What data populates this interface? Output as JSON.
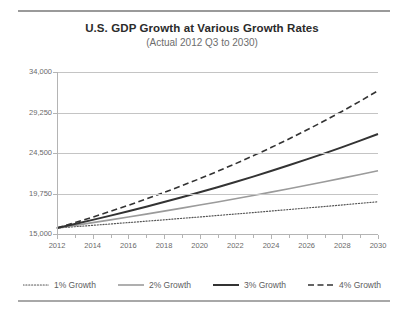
{
  "chart_data": {
    "type": "line",
    "title": "U.S. GDP Growth at Various Growth Rates",
    "subtitle": "(Actual 2012 Q3 to 2030)",
    "xlabel": "",
    "ylabel": "",
    "xlim": [
      2012,
      2030
    ],
    "ylim": [
      15000,
      34000
    ],
    "yticks": [
      "15,000",
      "19,750",
      "24,500",
      "29,250",
      "34,000"
    ],
    "ytick_values": [
      15000,
      19750,
      24500,
      29250,
      34000
    ],
    "xticks": [
      "2012",
      "2014",
      "2016",
      "2018",
      "2020",
      "2022",
      "2024",
      "2026",
      "2028",
      "2030"
    ],
    "xtick_values": [
      2012,
      2014,
      2016,
      2018,
      2020,
      2022,
      2024,
      2026,
      2028,
      2030
    ],
    "x": [
      2012,
      2013,
      2014,
      2015,
      2016,
      2017,
      2018,
      2019,
      2020,
      2021,
      2022,
      2023,
      2024,
      2025,
      2026,
      2027,
      2028,
      2029,
      2030
    ],
    "grid": true,
    "legend_position": "bottom",
    "series": [
      {
        "name": "1% Growth",
        "style": "dotted",
        "color": "#555555",
        "width": 1.2,
        "values": [
          15700,
          15857,
          16016,
          16176,
          16338,
          16501,
          16666,
          16833,
          17001,
          17171,
          17343,
          17516,
          17691,
          17868,
          18047,
          18227,
          18410,
          18594,
          18780
        ]
      },
      {
        "name": "2% Growth",
        "style": "solid",
        "color": "#9b9b9b",
        "width": 1.6,
        "values": [
          15700,
          16014,
          16334,
          16661,
          16994,
          17334,
          17681,
          18034,
          18395,
          18763,
          19138,
          19521,
          19911,
          20310,
          20716,
          21130,
          21553,
          21984,
          22424
        ]
      },
      {
        "name": "3% Growth",
        "style": "solid",
        "color": "#333333",
        "width": 2.0,
        "values": [
          15700,
          16171,
          16656,
          17156,
          17671,
          18201,
          18747,
          19309,
          19889,
          20485,
          21100,
          21733,
          22385,
          23056,
          23748,
          24461,
          25194,
          25950,
          26729
        ]
      },
      {
        "name": "4% Growth",
        "style": "dashed",
        "color": "#333333",
        "width": 1.6,
        "values": [
          15700,
          16328,
          16981,
          17660,
          18367,
          19101,
          19865,
          20660,
          21486,
          22346,
          23240,
          24169,
          25136,
          26141,
          27187,
          28274,
          29405,
          30582,
          31805
        ]
      }
    ]
  }
}
